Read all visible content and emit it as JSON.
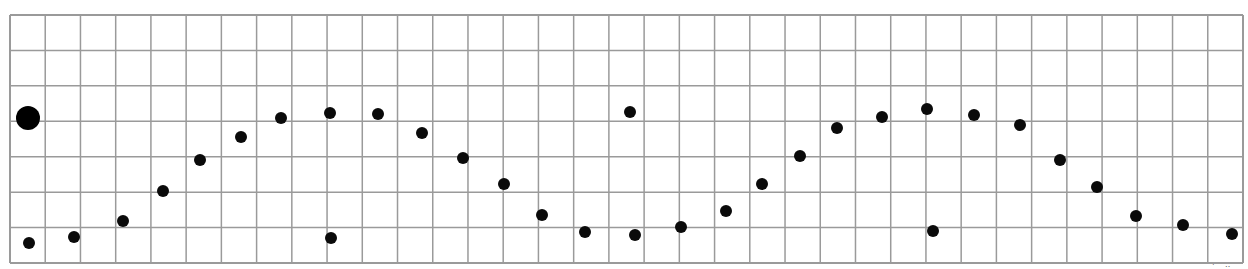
{
  "grid": {
    "left": 10,
    "top": 15,
    "right": 1243,
    "bottom": 263,
    "columns": 35,
    "rows": 7,
    "line_color": "#9a9a9a",
    "background": "#ffffff"
  },
  "marker": {
    "x": 28,
    "y": 118,
    "r": 12,
    "color": "#000000"
  },
  "dots": [
    {
      "x": 29,
      "y": 243
    },
    {
      "x": 74,
      "y": 237
    },
    {
      "x": 123,
      "y": 221
    },
    {
      "x": 163,
      "y": 191
    },
    {
      "x": 200,
      "y": 160
    },
    {
      "x": 241,
      "y": 137
    },
    {
      "x": 281,
      "y": 118
    },
    {
      "x": 330,
      "y": 113
    },
    {
      "x": 331,
      "y": 238
    },
    {
      "x": 378,
      "y": 114
    },
    {
      "x": 422,
      "y": 133
    },
    {
      "x": 463,
      "y": 158
    },
    {
      "x": 504,
      "y": 184
    },
    {
      "x": 542,
      "y": 215
    },
    {
      "x": 585,
      "y": 232
    },
    {
      "x": 630,
      "y": 112
    },
    {
      "x": 635,
      "y": 235
    },
    {
      "x": 681,
      "y": 227
    },
    {
      "x": 726,
      "y": 211
    },
    {
      "x": 762,
      "y": 184
    },
    {
      "x": 800,
      "y": 156
    },
    {
      "x": 837,
      "y": 128
    },
    {
      "x": 882,
      "y": 117
    },
    {
      "x": 927,
      "y": 109
    },
    {
      "x": 933,
      "y": 231
    },
    {
      "x": 974,
      "y": 115
    },
    {
      "x": 1020,
      "y": 125
    },
    {
      "x": 1060,
      "y": 160
    },
    {
      "x": 1097,
      "y": 187
    },
    {
      "x": 1136,
      "y": 216
    },
    {
      "x": 1183,
      "y": 225
    },
    {
      "x": 1232,
      "y": 234
    }
  ],
  "dot_radius": 6,
  "dot_color": "#0a0a0a",
  "corner_mark": "· ‥"
}
